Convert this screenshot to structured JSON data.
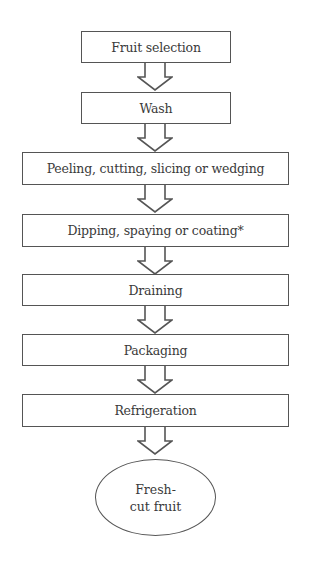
{
  "diagram": {
    "type": "flowchart",
    "steps": [
      {
        "label": "Fruit selection"
      },
      {
        "label": "Wash"
      },
      {
        "label": "Peeling, cutting, slicing or wedging"
      },
      {
        "label": "Dipping, spaying or coating*"
      },
      {
        "label": "Draining"
      },
      {
        "label": "Packaging"
      },
      {
        "label": "Refrigeration"
      }
    ],
    "end": {
      "line1": "Fresh-",
      "line2": "cut fruit"
    },
    "colors": {
      "stroke": "#555555",
      "text": "#3a3a3a",
      "background": "#ffffff"
    }
  }
}
